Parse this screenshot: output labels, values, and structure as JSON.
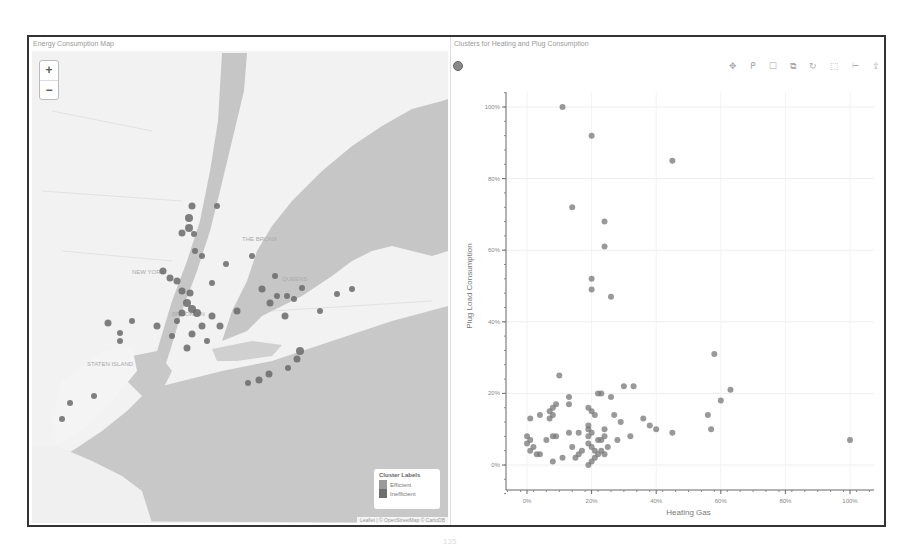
{
  "map_panel": {
    "title": "Energy Consumption Map",
    "zoom_in_label": "+",
    "zoom_out_label": "−",
    "place_labels": [
      "NEW YORK",
      "THE BRONX",
      "STATEN ISLAND",
      "BROOKLYN",
      "QUEENS"
    ],
    "legend": {
      "title": "Cluster Labels",
      "items": [
        {
          "label": "Efficient",
          "color": "#9a9a9a"
        },
        {
          "label": "Inefficient",
          "color": "#6e6e6e"
        }
      ]
    },
    "attribution": "Leaflet | © OpenStreetMap © CartoDB",
    "colors": {
      "water": "#c4c4c4",
      "land": "#f2f2f2",
      "marker": "#6a6a6a"
    }
  },
  "chart_panel": {
    "title": "Clusters for Heating and Plug Consumption",
    "toolbar": [
      {
        "name": "pan-icon",
        "glyph": "✥"
      },
      {
        "name": "lasso-icon",
        "glyph": "ᑭ"
      },
      {
        "name": "box-select-icon",
        "glyph": "☐"
      },
      {
        "name": "box-zoom-icon",
        "glyph": "⧉"
      },
      {
        "name": "reset-icon",
        "glyph": "↻"
      },
      {
        "name": "save-icon",
        "glyph": "⬚"
      },
      {
        "name": "hover-icon",
        "glyph": "⌲"
      },
      {
        "name": "help-icon",
        "glyph": "⇪"
      }
    ]
  },
  "chart_data": {
    "type": "scatter",
    "title": "Clusters for Heating and Plug Consumption",
    "xlabel": "Heating Gas",
    "ylabel": "Plug Load Consumption",
    "xticks": [
      "0%",
      "20%",
      "40%",
      "60%",
      "80%",
      "100%"
    ],
    "yticks": [
      "0%",
      "20%",
      "40%",
      "60%",
      "80%",
      "100%"
    ],
    "xlim": [
      -0.07,
      1.07
    ],
    "ylim": [
      -0.1,
      1.06
    ],
    "grid": true,
    "legend": "none",
    "series": [
      {
        "name": "points",
        "points": [
          [
            0.11,
            1.0
          ],
          [
            0.2,
            0.92
          ],
          [
            0.45,
            0.85
          ],
          [
            0.14,
            0.72
          ],
          [
            0.24,
            0.68
          ],
          [
            0.24,
            0.61
          ],
          [
            0.2,
            0.52
          ],
          [
            0.2,
            0.49
          ],
          [
            0.26,
            0.47
          ],
          [
            0.58,
            0.31
          ],
          [
            0.1,
            0.25
          ],
          [
            0.3,
            0.22
          ],
          [
            0.33,
            0.22
          ],
          [
            0.23,
            0.2
          ],
          [
            0.22,
            0.2
          ],
          [
            0.26,
            0.19
          ],
          [
            0.13,
            0.19
          ],
          [
            0.13,
            0.17
          ],
          [
            0.63,
            0.21
          ],
          [
            0.6,
            0.18
          ],
          [
            0.01,
            0.13
          ],
          [
            0.04,
            0.14
          ],
          [
            0.07,
            0.15
          ],
          [
            0.08,
            0.16
          ],
          [
            0.09,
            0.17
          ],
          [
            0.08,
            0.14
          ],
          [
            0.07,
            0.13
          ],
          [
            0.2,
            0.15
          ],
          [
            0.19,
            0.16
          ],
          [
            0.21,
            0.14
          ],
          [
            0.27,
            0.14
          ],
          [
            0.36,
            0.13
          ],
          [
            0.29,
            0.12
          ],
          [
            0.56,
            0.14
          ],
          [
            0.57,
            0.1
          ],
          [
            0.38,
            0.11
          ],
          [
            0.4,
            0.1
          ],
          [
            0.45,
            0.09
          ],
          [
            0.24,
            0.1
          ],
          [
            0.32,
            0.08
          ],
          [
            0.0,
            0.08
          ],
          [
            0.01,
            0.07
          ],
          [
            0.0,
            0.06
          ],
          [
            0.02,
            0.05
          ],
          [
            0.01,
            0.04
          ],
          [
            0.06,
            0.07
          ],
          [
            0.08,
            0.08
          ],
          [
            0.09,
            0.08
          ],
          [
            0.13,
            0.09
          ],
          [
            0.16,
            0.09
          ],
          [
            0.19,
            0.1
          ],
          [
            0.19,
            0.08
          ],
          [
            0.19,
            0.11
          ],
          [
            0.2,
            0.09
          ],
          [
            0.22,
            0.07
          ],
          [
            0.23,
            0.07
          ],
          [
            0.24,
            0.08
          ],
          [
            0.28,
            0.07
          ],
          [
            0.03,
            0.03
          ],
          [
            0.04,
            0.03
          ],
          [
            0.08,
            0.01
          ],
          [
            0.11,
            0.02
          ],
          [
            0.15,
            0.02
          ],
          [
            0.16,
            0.03
          ],
          [
            0.17,
            0.04
          ],
          [
            0.14,
            0.05
          ],
          [
            0.19,
            0.06
          ],
          [
            0.2,
            0.05
          ],
          [
            0.21,
            0.04
          ],
          [
            0.22,
            0.03
          ],
          [
            0.19,
            0.0
          ],
          [
            0.2,
            0.01
          ],
          [
            0.21,
            0.02
          ],
          [
            0.23,
            0.04
          ],
          [
            0.25,
            0.05
          ],
          [
            0.24,
            0.03
          ],
          [
            1.0,
            0.07
          ]
        ]
      }
    ]
  },
  "page_number": "135"
}
